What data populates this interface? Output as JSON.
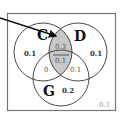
{
  "diagram": {
    "type": "venn",
    "sets": [
      {
        "id": "C",
        "label": "C",
        "cx": 43,
        "cy": 52,
        "r": 29
      },
      {
        "id": "D",
        "label": "D",
        "cx": 78,
        "cy": 52,
        "r": 29
      },
      {
        "id": "G",
        "label": "G",
        "cx": 61,
        "cy": 78,
        "r": 28
      }
    ],
    "regions": {
      "C_only": "0.1",
      "D_only": "0.1",
      "G_only": "0.2",
      "C_and_D_not_G": "0.3",
      "C_and_D_and_G": "0.1",
      "C_and_G_not_D": "0",
      "D_and_G_not_C": "0.1",
      "outside": "0.1"
    },
    "highlighted_region": "C_and_D",
    "highlight_color": "#c8c8c8",
    "border_color": "#777777",
    "circle_color": "#333333",
    "arrow_color": "#111111"
  }
}
